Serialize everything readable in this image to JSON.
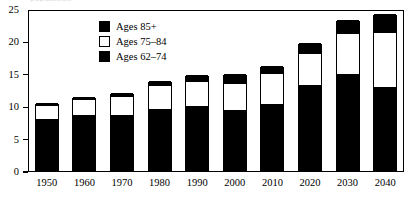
{
  "chart_data": {
    "type": "bar",
    "subtype": "stacked-vertical",
    "title": "",
    "title_remnant": "population",
    "xlabel": "",
    "ylabel": "",
    "ylim": [
      0,
      25
    ],
    "yticks": [
      0,
      5,
      10,
      15,
      20,
      25
    ],
    "grid": false,
    "legend_position": "top-center",
    "categories": [
      "1950",
      "1960",
      "1970",
      "1980",
      "1990",
      "2000",
      "2010",
      "2020",
      "2030",
      "2040"
    ],
    "series": [
      {
        "name": "Ages 62–74",
        "color": "#000000",
        "values": [
          8.0,
          8.6,
          8.7,
          9.5,
          10.0,
          9.4,
          10.3,
          13.3,
          15.0,
          13.0
        ]
      },
      {
        "name": "Ages 75–84",
        "color": "#ffffff",
        "values": [
          2.2,
          2.4,
          2.8,
          3.7,
          3.9,
          4.1,
          4.7,
          4.9,
          6.2,
          8.4
        ]
      },
      {
        "name": "Ages 85+",
        "color": "#000000",
        "values": [
          0.3,
          0.4,
          0.5,
          0.7,
          0.9,
          1.4,
          1.2,
          1.6,
          2.1,
          2.8
        ]
      }
    ],
    "totals": [
      10.5,
      11.4,
      12.0,
      13.9,
      14.8,
      14.9,
      16.2,
      19.8,
      23.3,
      24.2
    ]
  },
  "legend": {
    "items": [
      {
        "label": "Ages 85+",
        "swatch": "dark"
      },
      {
        "label": "Ages 75–84",
        "swatch": "light"
      },
      {
        "label": "Ages 62–74",
        "swatch": "dark"
      }
    ]
  },
  "axes": {
    "y_tick_labels": [
      "0",
      "5",
      "10",
      "15",
      "20",
      "25"
    ],
    "x_tick_labels": [
      "1950",
      "1960",
      "1970",
      "1980",
      "1990",
      "2000",
      "2010",
      "2020",
      "2030",
      "2040"
    ]
  }
}
